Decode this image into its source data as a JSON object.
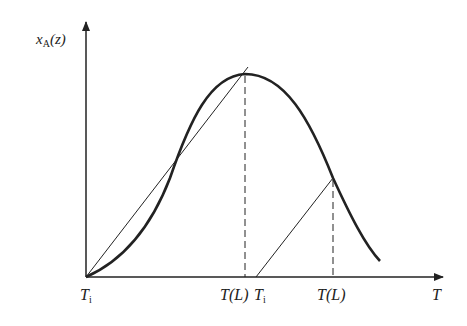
{
  "diagram": {
    "y_axis_label": {
      "main": "x",
      "sub": "A",
      "arg": "(z)"
    },
    "x_axis_label": "T",
    "tick_labels": [
      {
        "main": "T",
        "sub": "i",
        "x": 86
      },
      {
        "main": "T(L)",
        "sub": "",
        "x": 245
      },
      {
        "main": "T",
        "sub": "i",
        "x": 258
      },
      {
        "main": "T(L)",
        "sub": "",
        "x": 333
      }
    ],
    "curve": "bell-shaped conversion curve x_A(z) vs T",
    "lines": [
      "thin operating line from T_i tangent near peak T(L)",
      "thin operating line from second T_i intersecting curve at second T(L)",
      "dashed vertical at first T(L)",
      "dashed vertical at second T(L)"
    ],
    "colors": {
      "ink": "#222222",
      "background": "#ffffff"
    }
  }
}
